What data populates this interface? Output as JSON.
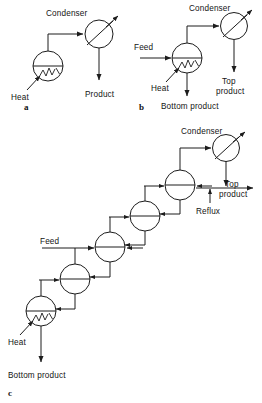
{
  "figure": {
    "type": "process-flow-diagram",
    "background_color": "#ffffff",
    "line_color": "#1c1c1c",
    "panel_count": 3
  },
  "panels": [
    {
      "id": "a",
      "caption": "a",
      "description": "Single reboiler stage with overhead condenser producing one product stream",
      "labels": {
        "condenser": "Condenser",
        "heat": "Heat",
        "product": "Product"
      },
      "units": [
        {
          "name": "reboiler",
          "symbol": "circle-with-heat-coil"
        },
        {
          "name": "condenser",
          "symbol": "circle-with-diagonal-arrow"
        }
      ],
      "streams": [
        "Heat",
        "Product"
      ]
    },
    {
      "id": "b",
      "caption": "b",
      "description": "Single stage with feed entry, reboiler heat input, condenser, top product and bottom product",
      "labels": {
        "condenser": "Condenser",
        "feed": "Feed",
        "heat": "Heat",
        "top_product": "Top\nproduct",
        "top_product_line1": "Top",
        "top_product_line2": "product",
        "bottom_product": "Bottom product"
      },
      "units": [
        {
          "name": "reboiler-stage",
          "symbol": "circle-with-heat-coil"
        },
        {
          "name": "condenser",
          "symbol": "circle-with-diagonal-arrow"
        }
      ],
      "streams": [
        "Feed",
        "Heat",
        "Top product",
        "Bottom product"
      ]
    },
    {
      "id": "c",
      "caption": "c",
      "description": "Cascade of five counter-current stages arranged diagonally, feed entering a middle stage, reboiler at the bottom and condenser at the top with reflux return",
      "labels": {
        "condenser": "Condenser",
        "reflux": "Reflux",
        "feed": "Feed",
        "heat": "Heat",
        "top_product_line1": "Top",
        "top_product_line2": "product",
        "bottom_product": "Bottom product"
      },
      "stage_count": 5,
      "units": [
        {
          "name": "stage-1-reboiler",
          "symbol": "circle-with-heat-coil"
        },
        {
          "name": "stage-2",
          "symbol": "circle"
        },
        {
          "name": "stage-3-feed",
          "symbol": "circle"
        },
        {
          "name": "stage-4",
          "symbol": "circle"
        },
        {
          "name": "stage-5",
          "symbol": "circle"
        },
        {
          "name": "condenser",
          "symbol": "circle-with-diagonal-arrow"
        }
      ],
      "streams": [
        "Feed",
        "Heat",
        "Reflux",
        "Top product",
        "Bottom product"
      ]
    }
  ]
}
